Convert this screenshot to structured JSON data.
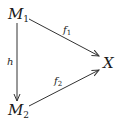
{
  "diagram": {
    "type": "commutative-diagram",
    "nodes": {
      "m1": {
        "base": "M",
        "sub": "1"
      },
      "m2": {
        "base": "M",
        "sub": "2"
      },
      "x": {
        "base": "X"
      }
    },
    "arrows": {
      "h": {
        "from": "M1",
        "to": "M2",
        "label": "h"
      },
      "f1": {
        "from": "M1",
        "to": "X",
        "label_base": "f",
        "label_sub": "1"
      },
      "f2": {
        "from": "M2",
        "to": "X",
        "label_base": "f",
        "label_sub": "2"
      }
    },
    "colors": {
      "stroke": "#333333",
      "text": "#1a1a1a",
      "background": "#ffffff"
    }
  }
}
